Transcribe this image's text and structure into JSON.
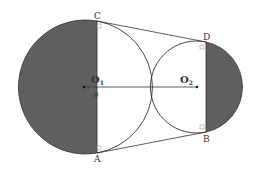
{
  "diagram": {
    "type": "geometry-two-tangent-circles-with-belt",
    "colors": {
      "shade": "#5f5f5f",
      "line": "#333333",
      "background": "#ffffff"
    },
    "circle1": {
      "center_label": "O",
      "center_sub": "1",
      "cx": 84,
      "cy": 87,
      "r": 67
    },
    "circle2": {
      "center_label": "O",
      "center_sub": "2",
      "cx": 197,
      "cy": 87,
      "r": 46
    },
    "points": {
      "C": {
        "label": "C",
        "x": 97,
        "y": 21
      },
      "A": {
        "label": "A",
        "x": 97,
        "y": 153
      },
      "D": {
        "label": "D",
        "x": 206,
        "y": 42
      },
      "B": {
        "label": "B",
        "x": 206,
        "y": 132
      }
    },
    "angle_label": "θ"
  }
}
